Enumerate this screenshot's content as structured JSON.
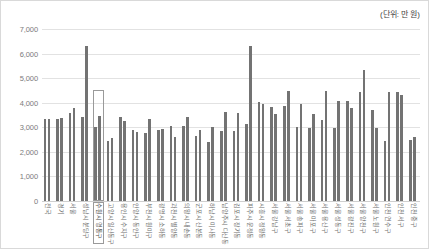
{
  "annotation": {
    "unit_note": "(단위: 만 원)"
  },
  "chart_data": {
    "type": "bar",
    "title": "",
    "subtitle": "",
    "xlabel": "",
    "ylabel": "",
    "annotations": [
      "(단위: 만 원)"
    ],
    "grid": true,
    "legend": "none",
    "ylim": [
      0,
      7000
    ],
    "yticks": [
      0,
      1000,
      2000,
      3000,
      4000,
      5000,
      6000,
      7000
    ],
    "ytick_labels": [
      "0",
      "1,000",
      "2,000",
      "3,000",
      "4,000",
      "5,000",
      "6,000",
      "7,000"
    ],
    "highlight_category": "수원시 영통구",
    "highlight_value_top": 4500,
    "categories": [
      "전국",
      "경기",
      "서울",
      "성남시 분당구",
      "수원시 영통구",
      "고양시 일산동구",
      "용인시 수지구",
      "안양시 동안구",
      "부천시 원미구",
      "광명시 소하동",
      "과천시 별양동",
      "의왕시 내손동",
      "군포시 산본동",
      "하남시 미사동",
      "남양주시 다산동",
      "김포시 장기동",
      "파주시 운정동",
      "시흥시 정왕동",
      "서울 강남구",
      "서울 서초구",
      "서울 송파구",
      "서울 마포구",
      "서울 용산구",
      "서울 성동구",
      "서울 광진구",
      "서울 양천구",
      "서울 노원구",
      "인천 연수구",
      "인천 서구",
      "인천 중구"
    ],
    "series": [
      {
        "name": "series-1",
        "values": [
          3350,
          3350,
          3580,
          3430,
          3030,
          2430,
          3400,
          2870,
          2750,
          2900,
          3060,
          3040,
          2650,
          2400,
          2840,
          2840,
          3130,
          4050,
          3830,
          3880,
          3020,
          2970,
          3280,
          2970,
          4070,
          4450,
          3710,
          2450,
          4450,
          2470
        ]
      },
      {
        "name": "series-2",
        "values": [
          3350,
          3370,
          3790,
          6320,
          3440,
          2580,
          3270,
          2810,
          3320,
          2920,
          2620,
          3400,
          2910,
          3010,
          3640,
          3570,
          6320,
          3960,
          3560,
          4470,
          3950,
          3560,
          4470,
          4080,
          3790,
          5340,
          2980,
          4430,
          4300,
          2620
        ]
      }
    ]
  }
}
